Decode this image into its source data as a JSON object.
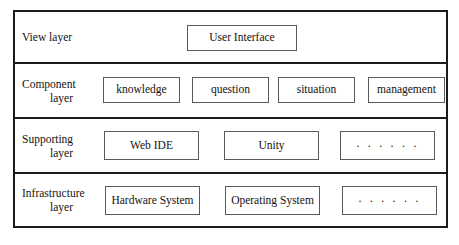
{
  "diagram": {
    "type": "layered-architecture",
    "layers": [
      {
        "id": "view",
        "label_line1": "View layer",
        "label_line2": "",
        "nodes": [
          {
            "id": "user-interface",
            "label": "User Interface"
          }
        ]
      },
      {
        "id": "component",
        "label_line1": "Component",
        "label_line2": "layer",
        "nodes": [
          {
            "id": "knowledge",
            "label": "knowledge"
          },
          {
            "id": "question",
            "label": "question"
          },
          {
            "id": "situation",
            "label": "situation"
          },
          {
            "id": "management",
            "label": "management"
          }
        ]
      },
      {
        "id": "supporting",
        "label_line1": "Supporting",
        "label_line2": "layer",
        "nodes": [
          {
            "id": "web-ide",
            "label": "Web IDE"
          },
          {
            "id": "unity",
            "label": "Unity"
          },
          {
            "id": "support-more",
            "label": "· · · · · ·"
          }
        ]
      },
      {
        "id": "infrastructure",
        "label_line1": "Infrastructure",
        "label_line2": "layer",
        "nodes": [
          {
            "id": "hardware-system",
            "label": "Hardware System"
          },
          {
            "id": "operating-system",
            "label": "Operating System"
          },
          {
            "id": "infra-more",
            "label": "· · · · · ·"
          }
        ]
      }
    ],
    "colors": {
      "background": "#ffffff",
      "outer_border": "#1b1b1b",
      "node_border": "#5a5a5a",
      "text": "#121212"
    }
  }
}
